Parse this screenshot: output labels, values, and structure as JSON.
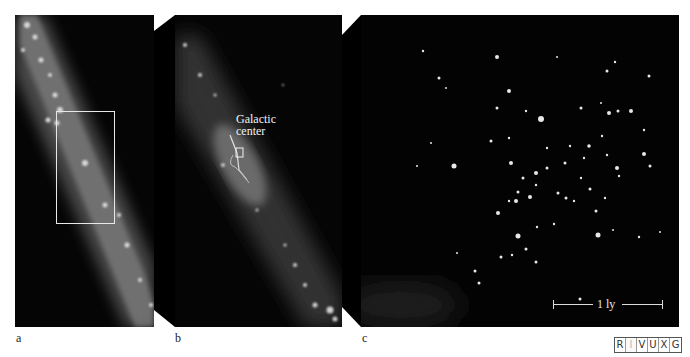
{
  "figure": {
    "panels": [
      {
        "id": "a",
        "label": "a",
        "description": "Wide-field infrared view of the Milky Way band with a rectangular zoom box"
      },
      {
        "id": "b",
        "label": "b",
        "description": "Zoomed view of the galactic center region",
        "annotation": "Galactic center"
      },
      {
        "id": "c",
        "label": "c",
        "description": "High-resolution view of dense star cluster near the galactic center",
        "scale_bar": "1 ly"
      }
    ],
    "annotation_line1": "Galactic",
    "annotation_line2": "center",
    "scale_bar_label": "1 ly",
    "wavelength_bands": [
      "R",
      "I",
      "V",
      "U",
      "X",
      "G"
    ],
    "active_band": "I",
    "colors": {
      "background": "#ffffff",
      "panel_bg": "#050505",
      "frame_outline": "#e8e8e8",
      "label_text": "#222222"
    }
  }
}
